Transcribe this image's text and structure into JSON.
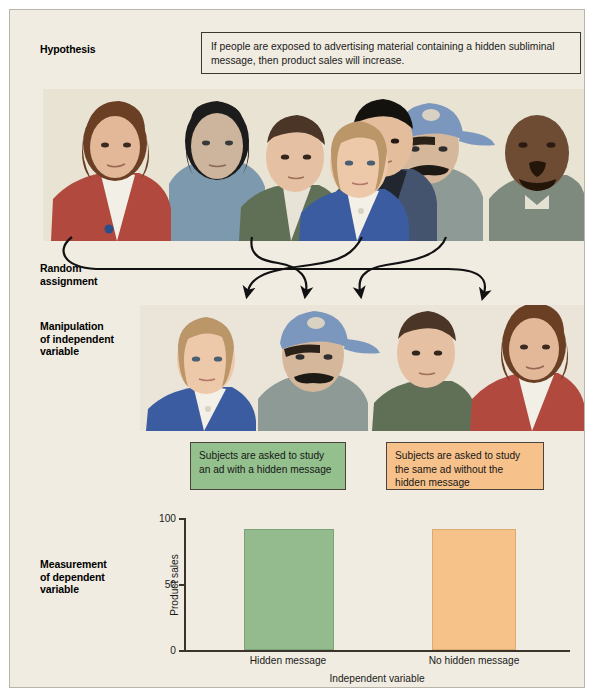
{
  "figure": {
    "background_color": "#f0ece1",
    "border_color": "#b9b5ab"
  },
  "stages": [
    {
      "id": "hypothesis",
      "label": "Hypothesis"
    },
    {
      "id": "random-assignment",
      "label": "Random\nassignment"
    },
    {
      "id": "manipulation",
      "label": "Manipulation\nof independent\nvariable"
    },
    {
      "id": "measurement",
      "label": "Measurement\nof dependent\nvariable"
    }
  ],
  "stage_labels": {
    "hypothesis": "Hypothesis",
    "random_assignment_line1": "Random",
    "random_assignment_line2": "assignment",
    "manipulation_line1": "Manipulation",
    "manipulation_line2": "of independent",
    "manipulation_line3": "variable",
    "measurement_line1": "Measurement",
    "measurement_line2": "of dependent",
    "measurement_line3": "variable"
  },
  "hypothesis": {
    "text": "If people are exposed to advertising material containing a hidden subliminal message, then product sales will increase."
  },
  "sample_panel": {
    "caption": "group of seven diverse people facing forward",
    "people_count": 7
  },
  "groups_panel": {
    "caption": "two groups of two people each",
    "people_count": 4
  },
  "treatments": [
    {
      "id": "experimental",
      "text": "Subjects are asked to study an ad with a hidden message",
      "color": "#93c08d"
    },
    {
      "id": "control",
      "text": "Subjects are asked to study the same ad without the hidden message",
      "color": "#f6c18a"
    }
  ],
  "arrows": {
    "count": 4,
    "color": "#111111",
    "description": "four crossing curved arrows from the full sample down to the two groups"
  },
  "chart_data": {
    "type": "bar",
    "title": "",
    "categories": [
      "Hidden message",
      "No hidden message"
    ],
    "values": [
      90,
      90
    ],
    "colors": [
      "#93bb8d",
      "#f6c289"
    ],
    "xlabel": "Independent variable",
    "ylabel": "Product sales",
    "ylim": [
      0,
      100
    ],
    "yticks": [
      0,
      50,
      100
    ],
    "ytick_labels": [
      "0",
      "50",
      "100"
    ],
    "grid": false,
    "legend": "none"
  }
}
